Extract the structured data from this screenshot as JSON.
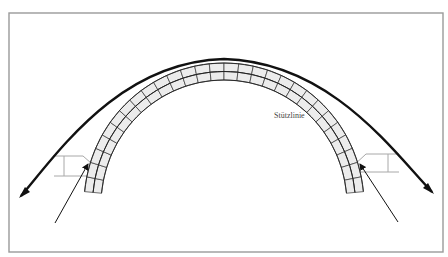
{
  "figure": {
    "type": "arch-thrust-line-diagram",
    "labels": {
      "thrust_line": "Stützlinie"
    },
    "elements": {
      "arch": "masonry arch with voussoirs (two courses)",
      "thrust_line": "thick curved line with arrowheads at both ends",
      "reactions": "thin arrows at both abutments pointing into arch springings",
      "abutments": "gray outline blocks at left and right springings"
    },
    "colors": {
      "frame": "#9a9a9a",
      "voussoir_fill": "#ececec",
      "lines": "#111111",
      "abutment": "#a8a8a8",
      "label": "#444444"
    }
  }
}
